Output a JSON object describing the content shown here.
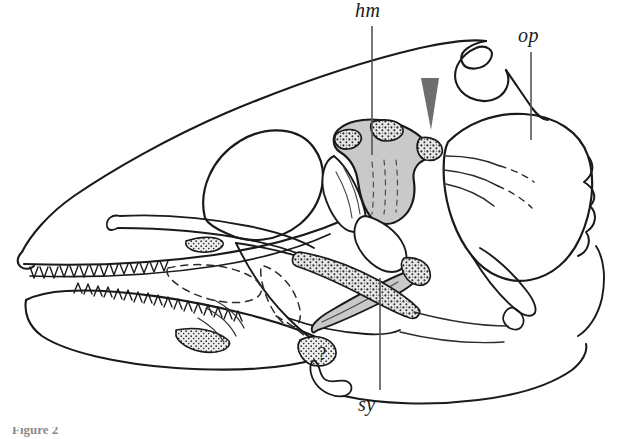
{
  "figure": {
    "domain": "scientific-illustration",
    "view": "left lateral",
    "caption_partial": "Figure 2",
    "line_color": "#1a1a1a",
    "shade_color": "#c9c9c9",
    "background_color": "#ffffff",
    "arrowhead_color": "#6e6e6e",
    "leader_color": "#555555"
  },
  "labels": [
    {
      "id": "hm",
      "text": "hm",
      "meaning": "hyomandibula",
      "x": 355,
      "y": -1,
      "leader": {
        "x1": 372,
        "y1": 26,
        "x2": 372,
        "y2": 155
      }
    },
    {
      "id": "op",
      "text": "op",
      "meaning": "operculum",
      "x": 518,
      "y": 24,
      "leader": {
        "x1": 531,
        "y1": 52,
        "x2": 531,
        "y2": 140
      }
    },
    {
      "id": "sy",
      "text": "sy",
      "meaning": "symplectic",
      "x": 358,
      "y": 393,
      "leader": {
        "x1": 380,
        "y1": 390,
        "x2": 380,
        "y2": 278
      }
    }
  ],
  "markers": [
    {
      "id": "arrowhead",
      "shape": "inverted-triangle",
      "meaning": "points to articulation region",
      "x": 430,
      "y": 78,
      "width": 18,
      "height": 52
    },
    {
      "id": "uncertainty-mark",
      "shape": "question-mark",
      "text": "?",
      "x": 323,
      "y": 352
    }
  ],
  "anatomy": [
    {
      "id": "neurocranium",
      "label": "braincase and snout",
      "shaded": false
    },
    {
      "id": "orbit",
      "label": "orbit",
      "shaded": false
    },
    {
      "id": "upper-jaw",
      "label": "upper jaw with tooth row",
      "shaded": false
    },
    {
      "id": "lower-jaw",
      "label": "lower jaw with tooth row",
      "shaded": false
    },
    {
      "id": "hyomandibula",
      "label": "hyomandibula",
      "shaded": true
    },
    {
      "id": "symplectic",
      "label": "symplectic",
      "shaded": true
    },
    {
      "id": "quadrate",
      "label": "quadrate",
      "shaded": true
    },
    {
      "id": "preopercle",
      "label": "preopercle",
      "shaded": false
    },
    {
      "id": "operculum",
      "label": "operculum",
      "shaded": false
    },
    {
      "id": "subopercle",
      "label": "subopercle",
      "shaded": false
    },
    {
      "id": "interopercle",
      "label": "interopercle",
      "shaded": false
    }
  ]
}
